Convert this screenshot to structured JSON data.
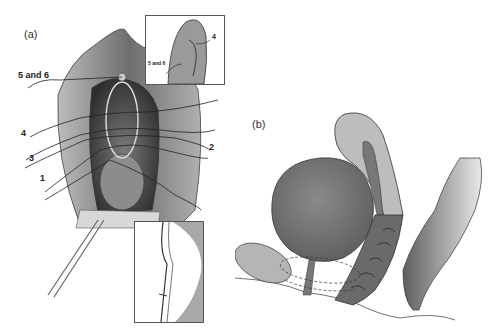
{
  "figure": {
    "panel_a": {
      "label": "(a)",
      "suture_labels": [
        "5 and 6",
        "4",
        "3",
        "1",
        "2"
      ],
      "inset_top": {
        "labels": [
          "4",
          "5 and 6"
        ]
      },
      "inset_bottom": {
        "labels": []
      }
    },
    "panel_b": {
      "label": "(b)",
      "suture_labels": [
        "1",
        "2",
        "3",
        "4",
        "5 and 6"
      ]
    }
  },
  "colors": {
    "ink": "#222222",
    "tissue_dark": "#5a5a5a",
    "tissue_mid": "#8a8a8a",
    "tissue_light": "#bdbdbd",
    "background": "#ffffff"
  }
}
